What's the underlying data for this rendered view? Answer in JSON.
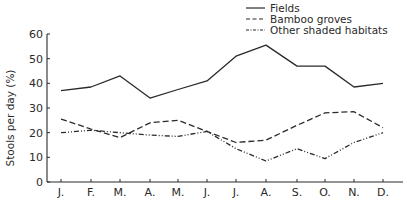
{
  "chart_data": {
    "type": "line",
    "title": "",
    "xlabel": "",
    "ylabel": "Stools per day (%)",
    "ylim": [
      0,
      60
    ],
    "yticks": [
      0,
      10,
      20,
      30,
      40,
      50,
      60
    ],
    "grid": false,
    "legend_position": "top-right",
    "categories": [
      "J.",
      "F.",
      "M.",
      "A.",
      "M.",
      "J.",
      "J.",
      "A.",
      "S.",
      "O.",
      "N.",
      "D."
    ],
    "series": [
      {
        "name": "Fields",
        "style": "solid",
        "values": [
          37,
          38.5,
          43,
          34,
          37.5,
          41,
          51,
          55.5,
          47,
          47,
          38.5,
          40
        ]
      },
      {
        "name": "Bamboo groves",
        "style": "dashed",
        "values": [
          25.5,
          21.5,
          18,
          24,
          25,
          20.5,
          16,
          17,
          23,
          28,
          28.5,
          22
        ]
      },
      {
        "name": "Other shaded habitats",
        "style": "dash-dot-dot",
        "values": [
          20,
          21,
          20,
          19,
          18.5,
          20.5,
          13.5,
          8.5,
          13.5,
          9.5,
          16,
          20
        ]
      }
    ]
  },
  "legend": {
    "items": [
      {
        "label": "Fields"
      },
      {
        "label": "Bamboo groves"
      },
      {
        "label": "Other shaded habitats"
      }
    ]
  },
  "axes": {
    "ylabel": "Stools per day (%)",
    "ytick_labels": [
      "0",
      "10",
      "20",
      "30",
      "40",
      "50",
      "60"
    ],
    "xtick_labels": [
      "J.",
      "F.",
      "M.",
      "A.",
      "M.",
      "J.",
      "J.",
      "A.",
      "S.",
      "O.",
      "N.",
      "D."
    ]
  },
  "colors": {
    "ink": "#2a2a2a",
    "background": "#ffffff"
  }
}
